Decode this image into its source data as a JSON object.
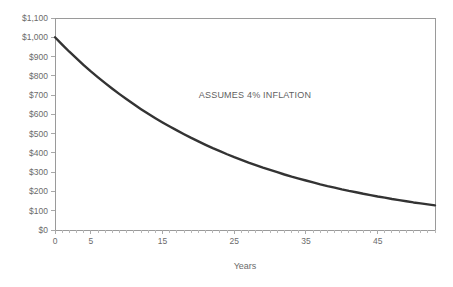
{
  "chart_data": {
    "type": "line",
    "title": "",
    "xlabel": "Years",
    "ylabel": "",
    "xlim": [
      0,
      53
    ],
    "ylim": [
      0,
      1100
    ],
    "grid": false,
    "legend": false,
    "annotations": [
      {
        "text": "ASSUMES 4% INFLATION",
        "x": 28,
        "y": 760
      }
    ],
    "y_tick_labels": [
      "$1,100",
      "$1,000",
      "$900",
      "$800",
      "$700",
      "$600",
      "$500",
      "$400",
      "$300",
      "$200",
      "$100",
      "$0"
    ],
    "y_tick_values": [
      1100,
      1000,
      900,
      800,
      700,
      600,
      500,
      400,
      300,
      200,
      100,
      0
    ],
    "x_tick_labels": [
      "0",
      "5",
      "15",
      "25",
      "35",
      "45"
    ],
    "x_tick_values": [
      0,
      5,
      15,
      25,
      35,
      45
    ],
    "x_minor_tick_step": 1,
    "series": [
      {
        "name": "Purchasing power of $1,000",
        "color": "#333333",
        "line_width": 2.4,
        "x": [
          0,
          1,
          2,
          3,
          4,
          5,
          6,
          7,
          8,
          9,
          10,
          11,
          12,
          13,
          14,
          15,
          16,
          17,
          18,
          19,
          20,
          21,
          22,
          23,
          24,
          25,
          26,
          27,
          28,
          29,
          30,
          31,
          32,
          33,
          34,
          35,
          36,
          37,
          38,
          39,
          40,
          41,
          42,
          43,
          44,
          45,
          46,
          47,
          48,
          49,
          50,
          51,
          52,
          53
        ],
        "values": [
          1000,
          962,
          925,
          890,
          856,
          823,
          792,
          762,
          733,
          705,
          678,
          652,
          627,
          603,
          580,
          558,
          537,
          517,
          497,
          478,
          460,
          442,
          425,
          409,
          393,
          378,
          364,
          350,
          337,
          324,
          312,
          300,
          288,
          277,
          267,
          257,
          247,
          237,
          228,
          220,
          211,
          203,
          196,
          188,
          181,
          174,
          168,
          161,
          155,
          149,
          143,
          138,
          133,
          128
        ]
      }
    ]
  },
  "plot_area": {
    "left": 55,
    "top": 18,
    "right": 435,
    "bottom": 230
  }
}
